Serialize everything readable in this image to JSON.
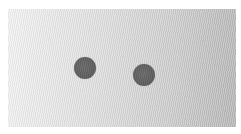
{
  "scene": {
    "description": "Two dark gray circular dots on a light textured gray surface with a left-to-right lightness gradient",
    "surface": {
      "x": 8,
      "y": 9,
      "width": 228,
      "height": 118,
      "color_left": "#f3f3f3",
      "color_right": "#b8b8b8"
    },
    "dots": [
      {
        "name": "left-dot",
        "cx": 85,
        "cy": 68,
        "r": 11,
        "color": "#5e5e5e"
      },
      {
        "name": "right-dot",
        "cx": 144,
        "cy": 75,
        "r": 11,
        "color": "#5e5e5e"
      }
    ]
  }
}
